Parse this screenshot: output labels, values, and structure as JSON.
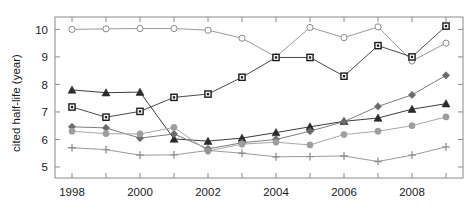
{
  "chart_data": {
    "type": "line",
    "title": "",
    "xlabel": "",
    "ylabel": "cited half-life (year)",
    "x": [
      1998,
      1999,
      2000,
      2001,
      2002,
      2003,
      2004,
      2005,
      2006,
      2007,
      2008,
      2009
    ],
    "xlim": [
      1997.5,
      2009.5
    ],
    "ylim": [
      4.6,
      10.45
    ],
    "yticks": [
      5,
      6,
      7,
      8,
      9,
      10
    ],
    "ytick_labels": [
      "5",
      "6",
      "7",
      "8",
      "9",
      "10"
    ],
    "xticks": [
      1998,
      1999,
      2000,
      2001,
      2002,
      2003,
      2004,
      2005,
      2006,
      2007,
      2008,
      2009
    ],
    "xtick_labels": [
      "1998",
      "",
      "2000",
      "",
      "2002",
      "",
      "2004",
      "",
      "2006",
      "",
      "2008",
      ""
    ],
    "grid": false,
    "legend": "none",
    "series": [
      {
        "name": "series-open-circle",
        "marker": "open-circle",
        "color": "#8a8a8a",
        "line_color": "#9a9a9a",
        "values": [
          10.0,
          10.02,
          10.03,
          10.03,
          9.97,
          9.68,
          9.0,
          10.07,
          9.7,
          10.09,
          8.85,
          9.5
        ]
      },
      {
        "name": "series-open-square",
        "marker": "open-square",
        "color": "#1b1b1b",
        "line_color": "#4a4a4a",
        "values": [
          7.18,
          6.81,
          7.02,
          7.53,
          7.65,
          8.26,
          8.98,
          8.98,
          8.3,
          9.41,
          9.0,
          10.12
        ]
      },
      {
        "name": "series-filled-triangle",
        "marker": "filled-triangle",
        "color": "#2a2a2a",
        "line_color": "#3d3d3d",
        "values": [
          7.8,
          7.7,
          7.72,
          6.02,
          5.94,
          6.05,
          6.25,
          6.46,
          6.66,
          6.78,
          7.1,
          7.3
        ]
      },
      {
        "name": "series-filled-diamond",
        "marker": "filled-diamond",
        "color": "#6b6b6b",
        "line_color": "#7d7d7d",
        "values": [
          6.46,
          6.42,
          6.05,
          6.2,
          5.66,
          5.88,
          6.0,
          6.3,
          6.65,
          7.2,
          7.62,
          8.33
        ]
      },
      {
        "name": "series-filled-circle",
        "marker": "filled-circle",
        "color": "#9e9e9e",
        "line_color": "#a8a8a8",
        "values": [
          6.3,
          6.21,
          6.2,
          6.44,
          5.58,
          5.83,
          5.9,
          5.8,
          6.18,
          6.3,
          6.5,
          6.82
        ]
      },
      {
        "name": "series-plus",
        "marker": "plus",
        "color": "#8f8f8f",
        "line_color": "#9a9a9a",
        "values": [
          5.7,
          5.63,
          5.43,
          5.44,
          5.6,
          5.5,
          5.37,
          5.38,
          5.4,
          5.2,
          5.43,
          5.73
        ]
      }
    ]
  },
  "axes": {
    "frame_color": "#8a8a8a"
  }
}
